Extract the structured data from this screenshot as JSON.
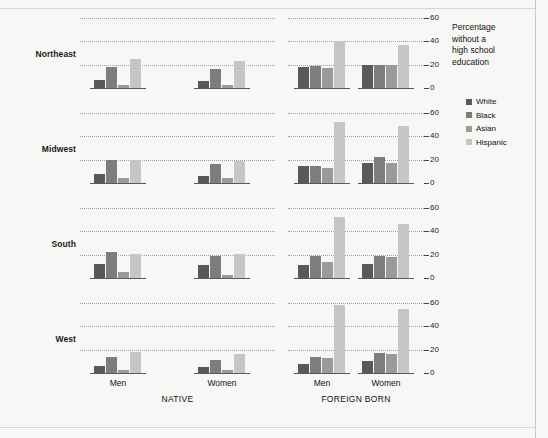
{
  "caption": {
    "lines": [
      "Percentage",
      "without a",
      "high school",
      "education"
    ],
    "text": "Percentage without a high school education"
  },
  "legend": {
    "items": [
      {
        "label": "White",
        "color": "#595959"
      },
      {
        "label": "Black",
        "color": "#7d7d7d"
      },
      {
        "label": "Asian",
        "color": "#9a9a9a"
      },
      {
        "label": "Hispanic",
        "color": "#c6c6c6"
      }
    ]
  },
  "axis": {
    "yticks": [
      "0",
      "20",
      "40",
      "60"
    ],
    "ymin": 0,
    "ymax": 60
  },
  "labels": {
    "men": "Men",
    "women": "Women",
    "native": "NATIVE",
    "foreign_born": "FOREIGN BORN"
  },
  "regions": [
    "Northeast",
    "Midwest",
    "South",
    "West"
  ],
  "chart_data": {
    "type": "bar",
    "title": "Percentage without a high school education",
    "xlabel": "",
    "ylabel": "Percentage without a high school education",
    "ylim": [
      0,
      60
    ],
    "yticks": [
      0,
      20,
      40,
      60
    ],
    "grid": true,
    "legend_position": "right",
    "layout": "small-multiples 4 rows (region) x 2 columns (nativity), grouped by sex",
    "row_facets": [
      "Northeast",
      "Midwest",
      "South",
      "West"
    ],
    "column_facets": [
      "NATIVE",
      "FOREIGN BORN"
    ],
    "group_facets": [
      "Men",
      "Women"
    ],
    "series": [
      "White",
      "Black",
      "Asian",
      "Hispanic"
    ],
    "panels": [
      {
        "region": "Northeast",
        "nativity": "NATIVE",
        "groups": [
          {
            "sex": "Men",
            "values": {
              "White": 7,
              "Black": 18,
              "Asian": 3,
              "Hispanic": 25
            }
          },
          {
            "sex": "Women",
            "values": {
              "White": 6,
              "Black": 16,
              "Asian": 3,
              "Hispanic": 23
            }
          }
        ]
      },
      {
        "region": "Northeast",
        "nativity": "FOREIGN BORN",
        "groups": [
          {
            "sex": "Men",
            "values": {
              "White": 18,
              "Black": 19,
              "Asian": 17,
              "Hispanic": 40
            }
          },
          {
            "sex": "Women",
            "values": {
              "White": 20,
              "Black": 20,
              "Asian": 20,
              "Hispanic": 37
            }
          }
        ]
      },
      {
        "region": "Midwest",
        "nativity": "NATIVE",
        "groups": [
          {
            "sex": "Men",
            "values": {
              "White": 8,
              "Black": 20,
              "Asian": 4,
              "Hispanic": 20
            }
          },
          {
            "sex": "Women",
            "values": {
              "White": 6,
              "Black": 16,
              "Asian": 4,
              "Hispanic": 19
            }
          }
        ]
      },
      {
        "region": "Midwest",
        "nativity": "FOREIGN BORN",
        "groups": [
          {
            "sex": "Men",
            "values": {
              "White": 15,
              "Black": 15,
              "Asian": 13,
              "Hispanic": 52
            }
          },
          {
            "sex": "Women",
            "values": {
              "White": 17,
              "Black": 22,
              "Asian": 17,
              "Hispanic": 49
            }
          }
        ]
      },
      {
        "region": "South",
        "nativity": "NATIVE",
        "groups": [
          {
            "sex": "Men",
            "values": {
              "White": 12,
              "Black": 22,
              "Asian": 5,
              "Hispanic": 21
            }
          },
          {
            "sex": "Women",
            "values": {
              "White": 11,
              "Black": 19,
              "Asian": 3,
              "Hispanic": 21
            }
          }
        ]
      },
      {
        "region": "South",
        "nativity": "FOREIGN BORN",
        "groups": [
          {
            "sex": "Men",
            "values": {
              "White": 11,
              "Black": 19,
              "Asian": 14,
              "Hispanic": 52
            }
          },
          {
            "sex": "Women",
            "values": {
              "White": 12,
              "Black": 19,
              "Asian": 18,
              "Hispanic": 46
            }
          }
        ]
      },
      {
        "region": "West",
        "nativity": "NATIVE",
        "groups": [
          {
            "sex": "Men",
            "values": {
              "White": 6,
              "Black": 14,
              "Asian": 3,
              "Hispanic": 18
            }
          },
          {
            "sex": "Women",
            "values": {
              "White": 5,
              "Black": 11,
              "Asian": 3,
              "Hispanic": 16
            }
          }
        ]
      },
      {
        "region": "West",
        "nativity": "FOREIGN BORN",
        "groups": [
          {
            "sex": "Men",
            "values": {
              "White": 8,
              "Black": 14,
              "Asian": 13,
              "Hispanic": 58
            }
          },
          {
            "sex": "Women",
            "values": {
              "White": 10,
              "Black": 17,
              "Asian": 16,
              "Hispanic": 55
            }
          }
        ]
      }
    ]
  }
}
